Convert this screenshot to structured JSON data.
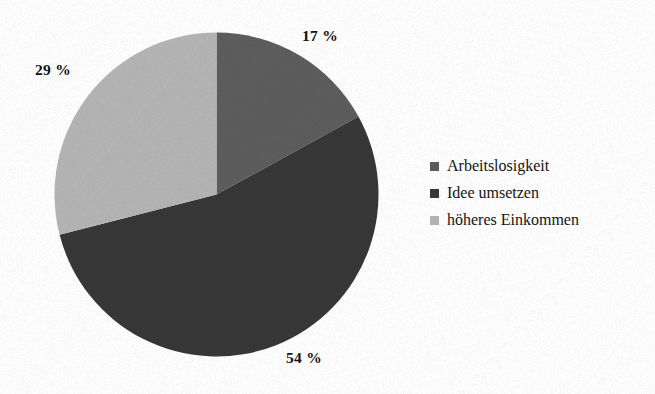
{
  "chart_data": {
    "type": "pie",
    "title": "",
    "subtitle": "",
    "xlabel": "",
    "ylabel": "",
    "grid": false,
    "legend_position": "right",
    "start_angle_deg": 0,
    "direction": "clockwise",
    "units": "%",
    "categories": [
      "Arbeitslosigkeit",
      "Idee umsetzen",
      "höheres Einkommen"
    ],
    "values": [
      17,
      54,
      29
    ],
    "data_labels": [
      "17 %",
      "54 %",
      "29 %"
    ],
    "colors": [
      "#5d5d5d",
      "#373737",
      "#b5b5b5"
    ],
    "slices": [
      {
        "label": "Arbeitslosigkeit",
        "value": 17,
        "data_label": "17 %",
        "color": "#5d5d5d",
        "start_deg": 0,
        "end_deg": 61.2
      },
      {
        "label": "Idee umsetzen",
        "value": 54,
        "data_label": "54 %",
        "color": "#373737",
        "start_deg": 61.2,
        "end_deg": 255.6
      },
      {
        "label": "höheres Einkommen",
        "value": 29,
        "data_label": "29 %",
        "color": "#b5b5b5",
        "start_deg": 255.6,
        "end_deg": 360
      }
    ]
  },
  "pie": {
    "center_x": 162.5,
    "center_y": 162.5,
    "radius": 162
  },
  "legend": {
    "items": [
      {
        "label": "Arbeitslosigkeit",
        "color": "#5d5d5d"
      },
      {
        "label": "Idee umsetzen",
        "color": "#373737"
      },
      {
        "label": "höheres Einkommen",
        "color": "#b5b5b5"
      }
    ]
  },
  "canvas": {
    "background": "#ffffff",
    "text_color": "#131313"
  }
}
